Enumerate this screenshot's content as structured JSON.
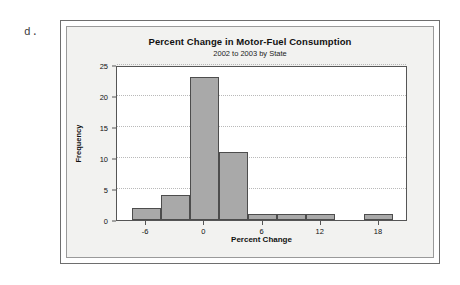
{
  "figure_label": "d.",
  "chart_data": {
    "type": "bar",
    "title": "Percent Change in Motor-Fuel Consumption",
    "subtitle": "2002 to 2003 by State",
    "xlabel": "Percent Change",
    "ylabel": "Frequency",
    "xlim": [
      -9,
      21
    ],
    "ylim": [
      0,
      25
    ],
    "grid": true,
    "legend": false,
    "bin_width": 3,
    "bar_color": "#a9a9a9",
    "bar_edge_color": "#4d4d4d",
    "x_tick_labels": [
      "-6",
      "0",
      "6",
      "12",
      "18"
    ],
    "x_tick_values": [
      -6,
      0,
      6,
      12,
      18
    ],
    "y_tick_labels": [
      "0",
      "5",
      "10",
      "15",
      "20",
      "25"
    ],
    "y_tick_values": [
      0,
      5,
      10,
      15,
      20,
      25
    ],
    "categories": [
      "-7.5 to -4.5",
      "-4.5 to -1.5",
      "-1.5 to 1.5",
      "1.5 to 4.5",
      "4.5 to 7.5",
      "7.5 to 10.5",
      "10.5 to 13.5",
      "13.5 to 16.5",
      "16.5 to 19.5"
    ],
    "bin_edges": [
      -7.5,
      -4.5,
      -1.5,
      1.5,
      4.5,
      7.5,
      10.5,
      13.5,
      16.5,
      19.5
    ],
    "values": [
      2,
      4,
      23,
      11,
      1,
      1,
      1,
      0,
      1
    ]
  }
}
